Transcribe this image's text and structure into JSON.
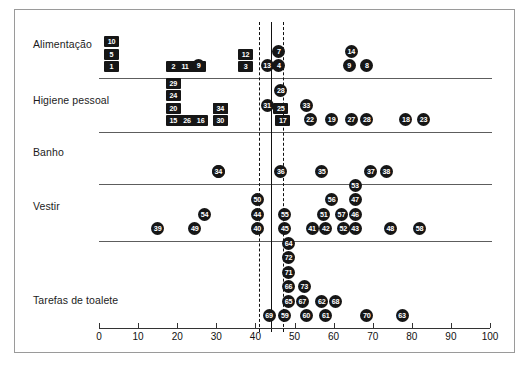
{
  "figure": {
    "caption": "",
    "frame_border_color": "#9a9a9a"
  },
  "chart_data": {
    "type": "scatter",
    "title": "",
    "xlabel": "",
    "ylabel": "",
    "xlim": [
      0,
      100
    ],
    "xticks": [
      0,
      10,
      20,
      30,
      40,
      50,
      60,
      70,
      80,
      90,
      100
    ],
    "xticklabels": [
      "0",
      "10",
      "20",
      "30",
      "40",
      "50",
      "60",
      "70",
      "80",
      "90",
      "100"
    ],
    "grid": false,
    "legend": "none",
    "reference_lines": [
      {
        "x": 41.0,
        "style": "dashed"
      },
      {
        "x": 44.0,
        "style": "solid"
      },
      {
        "x": 47.0,
        "style": "dashed"
      }
    ],
    "categories": [
      "Alimentação",
      "Higiene pessoal",
      "Banho",
      "Vestir",
      "Tarefas de toalete"
    ],
    "series": [
      {
        "name": "Alimentação",
        "marker": "square",
        "points": [
          {
            "label": "1",
            "x": 3.2,
            "stack": 0
          },
          {
            "label": "5",
            "x": 3.2,
            "stack": 1
          },
          {
            "label": "10",
            "x": 3.2,
            "stack": 2
          },
          {
            "label": "2",
            "x": 19.0,
            "stack": 0
          },
          {
            "label": "11",
            "x": 22.0,
            "stack": 0
          },
          {
            "label": "6",
            "x": 25.5,
            "stack": 0
          },
          {
            "label": "9",
            "x": 25.5,
            "stack": 0
          },
          {
            "label": "3",
            "x": 37.5,
            "stack": 0
          },
          {
            "label": "12",
            "x": 37.5,
            "stack": 1
          },
          {
            "label": "13",
            "x": 43.0,
            "stack": 0
          },
          {
            "label": "4",
            "x": 46.0,
            "stack": 0
          },
          {
            "label": "7",
            "x": 46.0,
            "stack": 1
          },
          {
            "label": "9",
            "x": 64.0,
            "stack": 0
          },
          {
            "label": "8",
            "x": 68.5,
            "stack": 0
          },
          {
            "label": "14",
            "x": 64.5,
            "stack": 1
          }
        ]
      },
      {
        "name": "Higiene pessoal",
        "marker": "square",
        "points": [
          {
            "label": "15",
            "x": 19.0,
            "stack": 0
          },
          {
            "label": "20",
            "x": 19.0,
            "stack": 1
          },
          {
            "label": "24",
            "x": 19.0,
            "stack": 2
          },
          {
            "label": "29",
            "x": 19.0,
            "stack": 3
          },
          {
            "label": "21",
            "x": 22.5,
            "stack": 0
          },
          {
            "label": "26",
            "x": 22.5,
            "stack": 0
          },
          {
            "label": "16",
            "x": 26.0,
            "stack": 0
          },
          {
            "label": "30",
            "x": 31.0,
            "stack": 0
          },
          {
            "label": "32",
            "x": 31.0,
            "stack": 1
          },
          {
            "label": "34",
            "x": 31.0,
            "stack": 1
          },
          {
            "label": "31",
            "x": 43.0,
            "stack": 1
          },
          {
            "label": "17",
            "x": 47.0,
            "stack": 0
          },
          {
            "label": "25",
            "x": 46.5,
            "stack": 1
          },
          {
            "label": "28",
            "x": 46.5,
            "stack": 2
          },
          {
            "label": "22",
            "x": 54.0,
            "stack": 0
          },
          {
            "label": "33",
            "x": 53.0,
            "stack": 1
          },
          {
            "label": "19",
            "x": 59.5,
            "stack": 0
          },
          {
            "label": "27",
            "x": 64.5,
            "stack": 0
          },
          {
            "label": "28",
            "x": 68.5,
            "stack": 0
          },
          {
            "label": "18",
            "x": 78.5,
            "stack": 0
          },
          {
            "label": "23",
            "x": 83.0,
            "stack": 0
          }
        ]
      },
      {
        "name": "Banho",
        "marker": "square",
        "points": [
          {
            "label": "32",
            "x": 30.5,
            "stack": 0
          },
          {
            "label": "34",
            "x": 30.5,
            "stack": 0
          },
          {
            "label": "36",
            "x": 46.5,
            "stack": 0
          },
          {
            "label": "35",
            "x": 57.0,
            "stack": 0
          },
          {
            "label": "37",
            "x": 69.5,
            "stack": 0
          },
          {
            "label": "38",
            "x": 73.5,
            "stack": 0
          }
        ]
      },
      {
        "name": "Vestir",
        "marker": "square",
        "points": [
          {
            "label": "39",
            "x": 15.0,
            "stack": 0
          },
          {
            "label": "49",
            "x": 24.5,
            "stack": 0
          },
          {
            "label": "54",
            "x": 27.0,
            "stack": 1
          },
          {
            "label": "40",
            "x": 40.5,
            "stack": 0
          },
          {
            "label": "44",
            "x": 40.5,
            "stack": 1
          },
          {
            "label": "50",
            "x": 40.5,
            "stack": 2
          },
          {
            "label": "45",
            "x": 47.5,
            "stack": 0
          },
          {
            "label": "55",
            "x": 47.5,
            "stack": 1
          },
          {
            "label": "41",
            "x": 54.5,
            "stack": 0
          },
          {
            "label": "42",
            "x": 58.0,
            "stack": 0
          },
          {
            "label": "51",
            "x": 57.5,
            "stack": 1
          },
          {
            "label": "56",
            "x": 59.5,
            "stack": 2
          },
          {
            "label": "52",
            "x": 62.5,
            "stack": 0
          },
          {
            "label": "57",
            "x": 62.0,
            "stack": 1
          },
          {
            "label": "43",
            "x": 65.5,
            "stack": 0
          },
          {
            "label": "46",
            "x": 65.5,
            "stack": 1
          },
          {
            "label": "47",
            "x": 65.5,
            "stack": 2
          },
          {
            "label": "53",
            "x": 65.5,
            "stack": 3
          },
          {
            "label": "48",
            "x": 74.5,
            "stack": 0
          },
          {
            "label": "58",
            "x": 82.0,
            "stack": 0
          }
        ]
      },
      {
        "name": "Tarefas de toalete",
        "marker": "square",
        "points": [
          {
            "label": "69",
            "x": 43.5,
            "stack": 0
          },
          {
            "label": "59",
            "x": 47.5,
            "stack": 0
          },
          {
            "label": "65",
            "x": 48.5,
            "stack": 1
          },
          {
            "label": "66",
            "x": 48.5,
            "stack": 2
          },
          {
            "label": "71",
            "x": 48.5,
            "stack": 3
          },
          {
            "label": "72",
            "x": 48.5,
            "stack": 4
          },
          {
            "label": "64",
            "x": 48.5,
            "stack": 5
          },
          {
            "label": "60",
            "x": 53.0,
            "stack": 0
          },
          {
            "label": "67",
            "x": 52.0,
            "stack": 1
          },
          {
            "label": "73",
            "x": 52.5,
            "stack": 2
          },
          {
            "label": "61",
            "x": 58.0,
            "stack": 0
          },
          {
            "label": "62",
            "x": 57.0,
            "stack": 1
          },
          {
            "label": "68",
            "x": 60.5,
            "stack": 1
          },
          {
            "label": "70",
            "x": 68.5,
            "stack": 0
          },
          {
            "label": "63",
            "x": 77.5,
            "stack": 0
          }
        ]
      }
    ]
  }
}
